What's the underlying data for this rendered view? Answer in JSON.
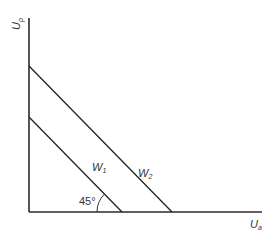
{
  "diagram": {
    "y_axis": {
      "label": "U",
      "subscript": "p"
    },
    "x_axis": {
      "label": "U",
      "subscript": "a"
    },
    "lines": [
      {
        "id": "W1",
        "label": "W",
        "subscript": "1"
      },
      {
        "id": "W2",
        "label": "W",
        "subscript": "2"
      }
    ],
    "angle": {
      "value": "45°"
    },
    "colors": {
      "line": "#222222",
      "text": "#333333",
      "background": "#ffffff"
    }
  }
}
